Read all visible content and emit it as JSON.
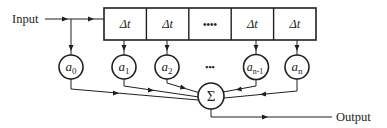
{
  "diagram": {
    "input_label": "Input",
    "output_label": "Output",
    "delay_cells": [
      {
        "label": "Δt"
      },
      {
        "label": "Δt"
      },
      {
        "label": "••••"
      },
      {
        "label": "Δt"
      },
      {
        "label": "Δt"
      }
    ],
    "coefficients": [
      {
        "base": "a",
        "sub": "0"
      },
      {
        "base": "a",
        "sub": "1"
      },
      {
        "base": "a",
        "sub": "2"
      },
      {
        "base": "a",
        "sub": "n-1"
      },
      {
        "base": "a",
        "sub": "n"
      }
    ],
    "ellipsis": "•••",
    "summer_label": "Σ",
    "colors": {
      "stroke": "#231f20",
      "background": "#ffffff"
    }
  }
}
